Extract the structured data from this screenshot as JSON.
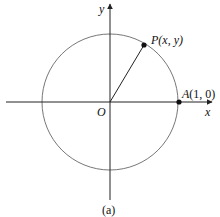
{
  "diagram": {
    "type": "unit-circle",
    "caption": "(a)",
    "axes": {
      "x_label": "x",
      "y_label": "y",
      "origin_label": "O"
    },
    "points": {
      "P": {
        "name": "P",
        "coords": "(x, y)"
      },
      "A": {
        "name": "A",
        "coords": "(1, 0)"
      }
    },
    "colors": {
      "axis": "#222222",
      "circle": "#777777",
      "point": "#111111"
    }
  }
}
